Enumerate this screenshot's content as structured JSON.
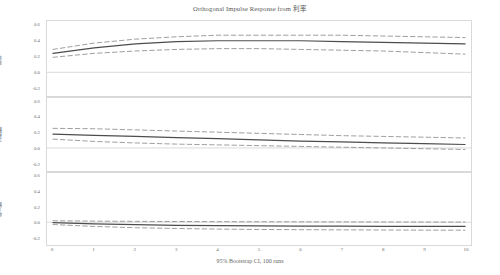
{
  "chart_data": {
    "type": "line",
    "title": "Orthogonal Impulse Response from 利率",
    "caption": "95% Bootstrap CI, 100 runs",
    "xlabel": "",
    "x": [
      0,
      1,
      2,
      3,
      4,
      5,
      6,
      7,
      8,
      9,
      10
    ],
    "xlim": [
      0,
      10
    ],
    "xticks": [
      "0",
      "1",
      "2",
      "3",
      "4",
      "5",
      "6",
      "7",
      "8",
      "9",
      "10"
    ],
    "grid": false,
    "legend": "none",
    "line_color": "#4d4d4d",
    "ci_color": "#8c8c8c",
    "zero_line_color": "#d0d0d0",
    "panels": [
      {
        "ylabel": "利率",
        "ylim": [
          -0.3,
          0.65
        ],
        "yticks": [
          "0.6",
          "0.4",
          "0.2",
          "0.0",
          "-0.2"
        ],
        "ytick_values": [
          0.6,
          0.4,
          0.2,
          0.0,
          -0.2
        ],
        "series": [
          {
            "name": "response",
            "style": "solid",
            "values": [
              0.24,
              0.31,
              0.36,
              0.39,
              0.4,
              0.4,
              0.4,
              0.39,
              0.38,
              0.37,
              0.36
            ]
          },
          {
            "name": "upper_ci",
            "style": "dashed",
            "values": [
              0.29,
              0.37,
              0.42,
              0.45,
              0.47,
              0.47,
              0.47,
              0.47,
              0.46,
              0.45,
              0.44
            ]
          },
          {
            "name": "lower_ci",
            "style": "dashed",
            "values": [
              0.19,
              0.24,
              0.27,
              0.29,
              0.3,
              0.3,
              0.29,
              0.28,
              0.27,
              0.25,
              0.23
            ]
          }
        ]
      },
      {
        "ylabel": "消费额",
        "ylim": [
          -0.3,
          0.65
        ],
        "yticks": [
          "0.6",
          "0.4",
          "0.2",
          "0.0",
          "-0.2"
        ],
        "ytick_values": [
          0.6,
          0.4,
          0.2,
          0.0,
          -0.2
        ],
        "series": [
          {
            "name": "response",
            "style": "solid",
            "values": [
              0.18,
              0.165,
              0.15,
              0.135,
              0.12,
              0.105,
              0.09,
              0.08,
              0.065,
              0.055,
              0.045
            ]
          },
          {
            "name": "upper_ci",
            "style": "dashed",
            "values": [
              0.255,
              0.25,
              0.235,
              0.22,
              0.205,
              0.19,
              0.175,
              0.16,
              0.15,
              0.14,
              0.13
            ]
          },
          {
            "name": "lower_ci",
            "style": "dashed",
            "values": [
              0.115,
              0.085,
              0.065,
              0.05,
              0.04,
              0.03,
              0.02,
              0.01,
              0.0,
              -0.01,
              -0.02
            ]
          }
        ]
      },
      {
        "ylabel": "收入额",
        "ylim": [
          -0.3,
          0.65
        ],
        "yticks": [
          "0.6",
          "0.4",
          "0.2",
          "0.0",
          "-0.2"
        ],
        "ytick_values": [
          0.6,
          0.4,
          0.2,
          0.0,
          -0.2
        ],
        "series": [
          {
            "name": "response",
            "style": "solid",
            "values": [
              -0.005,
              -0.02,
              -0.032,
              -0.04,
              -0.045,
              -0.048,
              -0.05,
              -0.052,
              -0.053,
              -0.054,
              -0.055
            ]
          },
          {
            "name": "upper_ci",
            "style": "dashed",
            "values": [
              0.02,
              0.015,
              0.012,
              0.01,
              0.008,
              0.007,
              0.006,
              0.005,
              0.004,
              0.003,
              0.002
            ]
          },
          {
            "name": "lower_ci",
            "style": "dashed",
            "values": [
              -0.03,
              -0.055,
              -0.072,
              -0.082,
              -0.09,
              -0.095,
              -0.098,
              -0.1,
              -0.102,
              -0.104,
              -0.105
            ]
          }
        ]
      }
    ]
  }
}
